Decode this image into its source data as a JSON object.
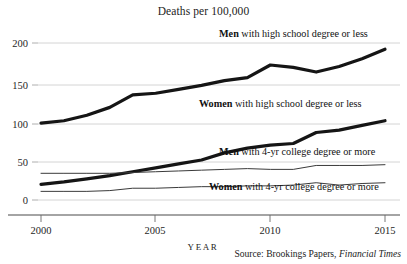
{
  "chart_data": {
    "type": "line",
    "title": "Deaths per 100,000",
    "xlabel": "YEAR",
    "ylabel": "",
    "xlim": [
      2000,
      2015
    ],
    "ylim": [
      0,
      210
    ],
    "grid": true,
    "legend_position": "inline-right",
    "x": [
      2000,
      2001,
      2002,
      2003,
      2004,
      2005,
      2006,
      2007,
      2008,
      2009,
      2010,
      2011,
      2012,
      2013,
      2014,
      2015
    ],
    "xticks": [
      2000,
      2005,
      2010,
      2015
    ],
    "xtick_labels": [
      "2000",
      "2005",
      "2010",
      "2015"
    ],
    "yticks": [
      0,
      50,
      100,
      150,
      200
    ],
    "ytick_labels": [
      "0",
      "50",
      "100",
      "150",
      "200"
    ],
    "series": [
      {
        "name": "Men with high school degree or less",
        "label_bold": "Men",
        "label_rest": " with high school degree or less",
        "style": "thick",
        "color": "#151515",
        "values": [
          98,
          101,
          108,
          118,
          134,
          136,
          141,
          146,
          152,
          156,
          172,
          169,
          163,
          170,
          180,
          192
        ]
      },
      {
        "name": "Women with high school degree or less",
        "label_bold": "Women",
        "label_rest": " with high school degree or less",
        "style": "thick",
        "color": "#151515",
        "values": [
          20,
          23,
          27,
          31,
          36,
          41,
          46,
          51,
          60,
          66,
          70,
          72,
          86,
          89,
          95,
          101
        ]
      },
      {
        "name": "Men with 4-yr college degree or more",
        "label_bold": "Men",
        "label_rest": " with 4-yr college degree or more",
        "style": "thin",
        "color": "#3a3a3a",
        "values": [
          34,
          34,
          34,
          34,
          35,
          36,
          37,
          38,
          39,
          40,
          39,
          39,
          44,
          44,
          44,
          45
        ]
      },
      {
        "name": "Women with 4-yr college degree or more",
        "label_bold": "Women",
        "label_rest": " with 4-yr college degree or more",
        "style": "thin",
        "color": "#3a3a3a",
        "values": [
          11,
          11,
          11,
          12,
          15,
          15,
          16,
          17,
          17,
          18,
          18,
          19,
          22,
          19,
          21,
          22
        ]
      }
    ],
    "source": {
      "prefix": "Source:  Brookings Papers, ",
      "publication": "Financial Times"
    }
  }
}
